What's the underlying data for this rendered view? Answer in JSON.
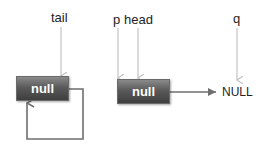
{
  "labels": {
    "tail": "tail",
    "p": "p",
    "head": "head",
    "q": "q",
    "null_terminal": "NULL"
  },
  "nodes": [
    {
      "id": "node-left",
      "value": "null"
    },
    {
      "id": "node-right",
      "value": "null"
    }
  ],
  "colors": {
    "pointer_arrow": "#c8c8c8",
    "link_arrow": "#6e6e6e",
    "node_fill": "#555555",
    "node_text": "#ffffff"
  }
}
